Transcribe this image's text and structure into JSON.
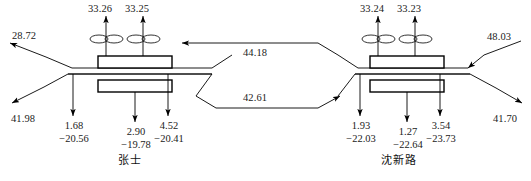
{
  "diagram": {
    "title": "",
    "type": "traffic-flow-schematic",
    "stations": [
      {
        "id": "station-left",
        "name": "张士",
        "ramp_flows_top": [
          "33.26",
          "33.25"
        ],
        "ground_flows": [
          {
            "upper": "1.68",
            "lower": "−20.56"
          },
          {
            "upper": "2.90",
            "lower": "−19.78"
          },
          {
            "upper": "4.52",
            "lower": "−20.41"
          }
        ]
      },
      {
        "id": "station-right",
        "name": "沈新路",
        "ramp_flows_top": [
          "33.24",
          "33.23"
        ],
        "ground_flows": [
          {
            "upper": "1.93",
            "lower": "−22.03"
          },
          {
            "upper": "1.27",
            "lower": "−22.64"
          },
          {
            "upper": "3.54",
            "lower": "−23.73"
          }
        ]
      }
    ],
    "edge_flows": {
      "left_upper_out": "28.72",
      "left_lower_out": "41.98",
      "right_upper_in": "48.03",
      "right_lower_out": "41.70"
    },
    "mainline_flows": {
      "westbound": "44.18",
      "eastbound": "42.61"
    },
    "colors": {
      "line": "#000000",
      "text": "#222222",
      "background": "#ffffff"
    }
  }
}
